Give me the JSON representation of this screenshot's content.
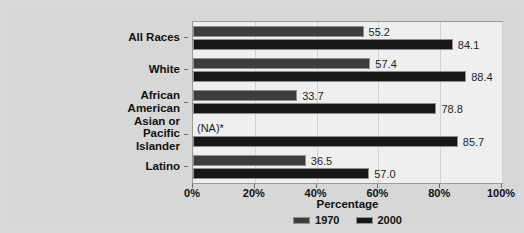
{
  "top_cut_text": "",
  "chart_data": {
    "type": "bar",
    "orientation": "horizontal",
    "title": "",
    "xlabel": "Percentage",
    "ylabel": "",
    "xlim": [
      0,
      100
    ],
    "grid": true,
    "legend_position": "bottom",
    "categories": [
      "All Races",
      "White",
      "African American",
      "Asian or Pacific Islander",
      "Latino"
    ],
    "category_lines": [
      [
        "All Races"
      ],
      [
        "White"
      ],
      [
        "African",
        "American"
      ],
      [
        "Asian or",
        "Pacific",
        "Islander"
      ],
      [
        "Latino"
      ]
    ],
    "series": [
      {
        "name": "1970",
        "color": "#3d3d3d",
        "values": [
          55.2,
          57.4,
          33.7,
          null,
          36.5
        ],
        "labels": [
          "55.2",
          "57.4",
          "33.7",
          "(NA)*",
          "36.5"
        ]
      },
      {
        "name": "2000",
        "color": "#171717",
        "values": [
          84.1,
          88.4,
          78.8,
          85.7,
          57.0
        ],
        "labels": [
          "84.1",
          "88.4",
          "78.8",
          "85.7",
          "57.0"
        ]
      }
    ],
    "xticks": [
      0,
      20,
      40,
      60,
      80,
      100
    ],
    "xtick_labels": [
      "0%",
      "20%",
      "40%",
      "60%",
      "80%",
      "100%"
    ],
    "na_marker": "(NA)*"
  },
  "legend": {
    "items": [
      {
        "label": "1970",
        "color": "#3d3d3d"
      },
      {
        "label": "2000",
        "color": "#171717"
      }
    ]
  }
}
